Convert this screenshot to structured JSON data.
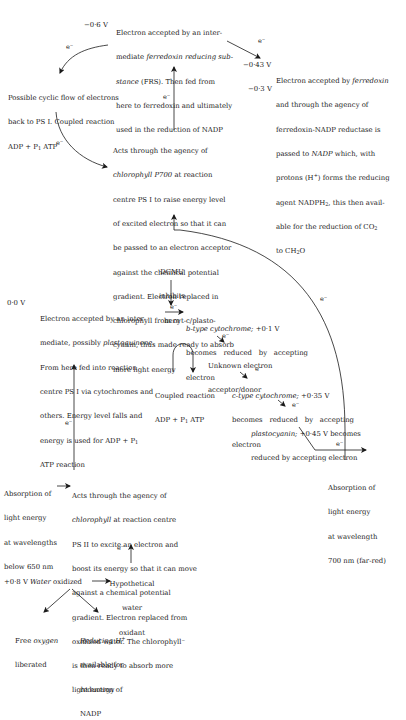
{
  "diagram": {
    "type": "Z-scheme photosynthetic electron transport",
    "electron_label": "e⁻",
    "nodes": {
      "frs": {
        "potential": "−0·6 V",
        "lines": [
          "Electron accepted by an inter-",
          "mediate ferredoxin reducing sub-",
          "stance (FRS). Then fed from",
          "here to ferredoxin and ultimately",
          "used in the reduction of NADP"
        ]
      },
      "ferredoxin": {
        "potential_1": "−0·43 V",
        "potential_2": "−0·3 V",
        "lines": [
          "Electron accepted by ferredoxin",
          "and through the agency of",
          "ferredoxin-NADP reductase is",
          "passed to NADP which, with",
          "protons (H⁺) forms the reducing",
          "agent NADPH₂, this then avail-",
          "able for the reduction of CO₂",
          "to CH₂O"
        ]
      },
      "cyclic": {
        "lines": [
          "Possible cyclic flow of electrons",
          "back to PS I. Coupled reaction",
          "ADP + P₁ ATP"
        ]
      },
      "ps1": {
        "lines": [
          "Acts through the agency of",
          "chlorophyll P700 at reaction",
          "centre PS I to raise energy level",
          "of excited electron so that it can",
          "be passed to an electron acceptor",
          "against the chemical potential",
          "gradient. Electron replaced in",
          "chlorophyll from cyt-c/plasto-",
          "cyanin, thus made ready to absorb",
          "more light energy"
        ]
      },
      "dcmu": {
        "lines": [
          "DCMU",
          "inhibits",
          "here"
        ]
      },
      "plastoquinone": {
        "potential": "0·0 V",
        "lines": [
          "Electron accepted by an inter-",
          "mediate, possibly plastoquinone.",
          "From here fed into reaction",
          "centre PS I via cytochromes and",
          "others. Energy level falls and",
          "energy is used for ADP + P₁",
          "ATP reaction"
        ]
      },
      "cyt_b": {
        "name": "b-type cytochrome;",
        "potential": "+0·1 V",
        "lines": [
          "becomes reduced by accepting",
          "electron"
        ]
      },
      "unknown": {
        "lines": [
          "Unknown electron",
          "acceptor/donor"
        ]
      },
      "coupled": {
        "lines": [
          "Coupled reaction",
          "ADP + P₁ ATP"
        ]
      },
      "cyt_c": {
        "name": "c-type cytochrome;",
        "potential": "+0·35 V",
        "lines": [
          "becomes reduced by accepting",
          "electron"
        ]
      },
      "plastocyanin": {
        "name": "plastocyanin;",
        "potential": "+0·45 V",
        "lines": [
          "becomes",
          "reduced by accepting electron"
        ]
      },
      "far_red": {
        "lines": [
          "Absorption of",
          "light energy",
          "at wavelength",
          "700 nm (far-red)"
        ]
      },
      "light_650": {
        "lines": [
          "Absorption of",
          "light energy",
          "at wavelengths",
          "below 650 nm"
        ]
      },
      "ps2": {
        "lines": [
          "Acts through the agency of",
          "chlorophyll at reaction centre",
          "PS II to excite an electron and",
          "boost its energy so that it can move",
          "against a chemical potential",
          "gradient. Electron replaced from",
          "oxidized water. The chlorophyll⁻",
          "is then ready to absorb more",
          "light energy"
        ]
      },
      "water": {
        "potential": "+0·8 V",
        "name": "Water",
        "text": "oxidized"
      },
      "oxidant": {
        "lines": [
          "Hypothetical",
          "water",
          "oxidant"
        ]
      },
      "oxygen": {
        "lines": [
          "Free oxygen",
          "liberated"
        ]
      },
      "reducing_h": {
        "lines": [
          "Reducing H⁺",
          "available for",
          "reduction of",
          "NADP"
        ]
      }
    }
  }
}
